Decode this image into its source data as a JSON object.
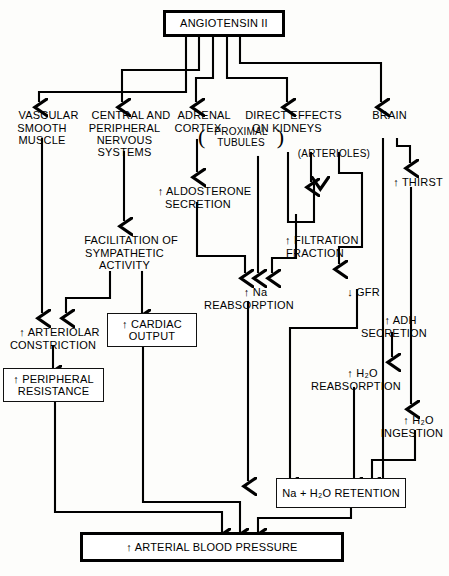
{
  "diagram": {
    "type": "flowchart",
    "ink_color": "#000000",
    "background_color": "#fdfdfb",
    "nodes": {
      "angiotensin": {
        "label": "ANGIOTENSIN II",
        "style": "heavy-box"
      },
      "vascular": {
        "label": "VASCULAR\nSMOOTH\nMUSCLE",
        "style": "plain"
      },
      "nervous": {
        "label": "CENTRAL AND\nPERIPHERAL\nNERVOUS\nSYSTEMS",
        "style": "plain"
      },
      "adrenal": {
        "label": "ADRENAL\nCORTEX",
        "style": "plain"
      },
      "kidneys": {
        "label": "DIRECT EFFECTS\nON KIDNEYS",
        "style": "plain"
      },
      "brain": {
        "label": "BRAIN",
        "style": "plain"
      },
      "proximal_tubules": {
        "label": "PROXIMAL\nTUBULES",
        "style": "parenthesized"
      },
      "arterioles": {
        "label": "(ARTERIOLES)",
        "style": "plain"
      },
      "aldosterone": {
        "label": "↑ ALDOSTERONE\nSECRETION",
        "style": "plain"
      },
      "facilitation": {
        "label": "FACILITATION OF\nSYMPATHETIC\nACTIVITY",
        "style": "plain"
      },
      "filtration": {
        "label": "↑ FILTRATION\nFRACTION",
        "style": "plain"
      },
      "thirst": {
        "label": "↑ THIRST",
        "style": "plain"
      },
      "na_reabsorption": {
        "label": "↑ Na\nREABSORPTION",
        "style": "plain"
      },
      "gfr": {
        "label": "↓ GFR",
        "style": "plain"
      },
      "adh": {
        "label": "↑ ADH\nSECRETION",
        "style": "plain"
      },
      "arteriolar": {
        "label": "↑ ARTERIOLAR\nCONSTRICTION",
        "style": "plain"
      },
      "cardiac_output": {
        "label": "↑ CARDIAC\nOUTPUT",
        "style": "box"
      },
      "h2o_reabsorption": {
        "label": "↑ H₂O\nREABSORPTION",
        "style": "plain"
      },
      "peripheral_resistance": {
        "label": "↑ PERIPHERAL\nRESISTANCE",
        "style": "box"
      },
      "h2o_ingestion": {
        "label": "↑ H₂O\nINGESTION",
        "style": "plain"
      },
      "na_h2o_retention": {
        "label": "Na + H₂O RETENTION",
        "style": "box"
      },
      "arterial_bp": {
        "label": "↑ ARTERIAL BLOOD PRESSURE",
        "style": "heavy-box"
      }
    },
    "edges": [
      {
        "from": "angiotensin",
        "to": "vascular"
      },
      {
        "from": "angiotensin",
        "to": "nervous"
      },
      {
        "from": "angiotensin",
        "to": "adrenal"
      },
      {
        "from": "angiotensin",
        "to": "kidneys"
      },
      {
        "from": "angiotensin",
        "to": "brain"
      },
      {
        "from": "vascular",
        "to": "arteriolar"
      },
      {
        "from": "nervous",
        "to": "facilitation"
      },
      {
        "from": "facilitation",
        "to": "arteriolar"
      },
      {
        "from": "facilitation",
        "to": "cardiac_output"
      },
      {
        "from": "adrenal",
        "to": "aldosterone"
      },
      {
        "from": "aldosterone",
        "to": "na_reabsorption"
      },
      {
        "from": "proximal_tubules",
        "to": "na_reabsorption"
      },
      {
        "from": "arterioles",
        "to": "filtration"
      },
      {
        "from": "arterioles",
        "to": "gfr"
      },
      {
        "from": "filtration",
        "to": "na_reabsorption"
      },
      {
        "from": "brain",
        "to": "thirst"
      },
      {
        "from": "brain",
        "to": "adh"
      },
      {
        "from": "gfr",
        "to": "na_h2o_retention"
      },
      {
        "from": "adh",
        "to": "h2o_reabsorption"
      },
      {
        "from": "thirst",
        "to": "h2o_ingestion"
      },
      {
        "from": "na_reabsorption",
        "to": "na_h2o_retention"
      },
      {
        "from": "h2o_reabsorption",
        "to": "na_h2o_retention"
      },
      {
        "from": "h2o_ingestion",
        "to": "na_h2o_retention"
      },
      {
        "from": "arteriolar",
        "to": "peripheral_resistance"
      },
      {
        "from": "peripheral_resistance",
        "to": "arterial_bp"
      },
      {
        "from": "cardiac_output",
        "to": "arterial_bp"
      },
      {
        "from": "na_h2o_retention",
        "to": "arterial_bp"
      }
    ]
  }
}
